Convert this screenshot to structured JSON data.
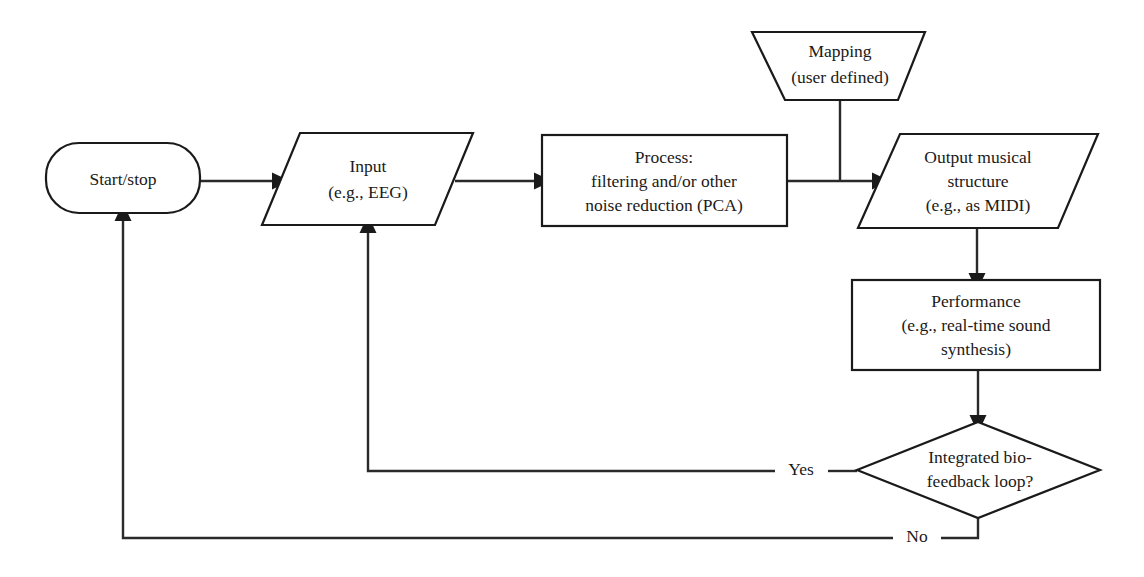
{
  "diagram": {
    "background_color": "#ffffff",
    "line_color": "#1a1a1a",
    "nodes": {
      "start_stop": {
        "shape": "rounded-rectangle",
        "lines": [
          "Start/stop"
        ]
      },
      "input": {
        "shape": "parallelogram",
        "lines": [
          "Input",
          "(e.g., EEG)"
        ]
      },
      "process": {
        "shape": "rectangle",
        "lines": [
          "Process:",
          "filtering and/or other",
          "noise reduction (PCA)"
        ]
      },
      "mapping": {
        "shape": "trapezoid",
        "lines": [
          "Mapping",
          "(user defined)"
        ]
      },
      "output": {
        "shape": "parallelogram",
        "lines": [
          "Output musical",
          "structure",
          "(e.g., as MIDI)"
        ]
      },
      "performance": {
        "shape": "rectangle",
        "lines": [
          "Performance",
          "(e.g., real-time sound",
          "synthesis)"
        ]
      },
      "decision": {
        "shape": "diamond",
        "lines": [
          "Integrated bio-",
          "feedback loop?"
        ]
      }
    },
    "edge_labels": {
      "yes": "Yes",
      "no": "No"
    }
  }
}
